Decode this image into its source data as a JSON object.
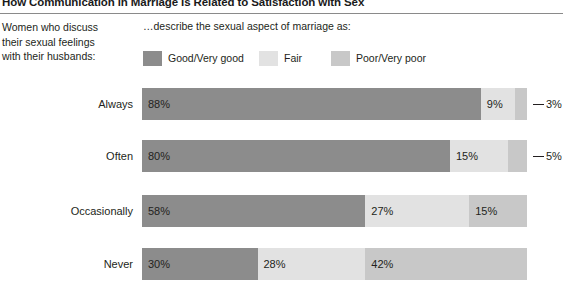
{
  "header": {
    "title": "How Communication in Marriage Is Related to Satisfaction with Sex"
  },
  "stub": {
    "line1": "Women who discuss",
    "line2": "their sexual feelings",
    "line3": "with their husbands:"
  },
  "legend_title": "…describe the sexual aspect of marriage as:",
  "colors": {
    "good": "#8c8c8c",
    "fair": "#e2e2e2",
    "poor": "#c8c8c8",
    "text": "#231f20",
    "rule": "#8a8a8a"
  },
  "chart_data": {
    "type": "bar",
    "orientation": "horizontal",
    "stacked": true,
    "normalized_percent": true,
    "title": "How Communication in Marriage Is Related to Satisfaction with Sex",
    "subtitle": "…describe the sexual aspect of marriage as:",
    "xlabel": "",
    "ylabel": "Women who discuss their sexual feelings with their husbands:",
    "xlim": [
      0,
      100
    ],
    "grid": false,
    "legend_position": "top",
    "categories": [
      "Always",
      "Often",
      "Occasionally",
      "Never"
    ],
    "series": [
      {
        "name": "Good/Very good",
        "color": "#8c8c8c",
        "values": [
          88,
          80,
          58,
          30
        ]
      },
      {
        "name": "Fair",
        "color": "#e2e2e2",
        "values": [
          9,
          15,
          27,
          28
        ]
      },
      {
        "name": "Poor/Very poor",
        "color": "#c8c8c8",
        "values": [
          3,
          5,
          15,
          42
        ]
      }
    ],
    "rows": [
      {
        "label": "Always",
        "segments": [
          {
            "series": "Good/Very good",
            "value": 88,
            "value_label": "88%",
            "callout": false
          },
          {
            "series": "Fair",
            "value": 9,
            "value_label": "9%",
            "callout": false
          },
          {
            "series": "Poor/Very poor",
            "value": 3,
            "value_label": "3%",
            "callout": true
          }
        ]
      },
      {
        "label": "Often",
        "segments": [
          {
            "series": "Good/Very good",
            "value": 80,
            "value_label": "80%",
            "callout": false
          },
          {
            "series": "Fair",
            "value": 15,
            "value_label": "15%",
            "callout": false
          },
          {
            "series": "Poor/Very poor",
            "value": 5,
            "value_label": "5%",
            "callout": true
          }
        ]
      },
      {
        "label": "Occasionally",
        "segments": [
          {
            "series": "Good/Very good",
            "value": 58,
            "value_label": "58%",
            "callout": false
          },
          {
            "series": "Fair",
            "value": 27,
            "value_label": "27%",
            "callout": false
          },
          {
            "series": "Poor/Very poor",
            "value": 15,
            "value_label": "15%",
            "callout": false
          }
        ]
      },
      {
        "label": "Never",
        "segments": [
          {
            "series": "Good/Very good",
            "value": 30,
            "value_label": "30%",
            "callout": false
          },
          {
            "series": "Fair",
            "value": 28,
            "value_label": "28%",
            "callout": false
          },
          {
            "series": "Poor/Very poor",
            "value": 42,
            "value_label": "42%",
            "callout": false
          }
        ]
      }
    ]
  }
}
